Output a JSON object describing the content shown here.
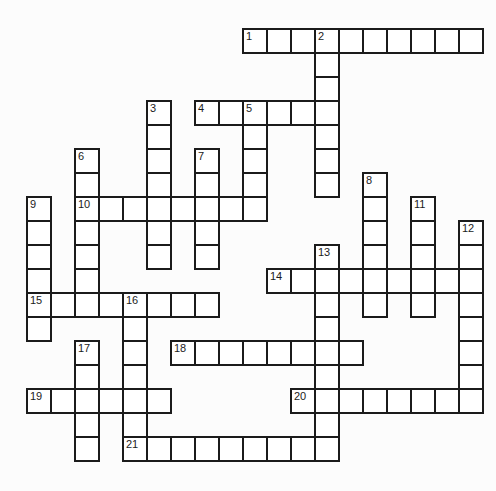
{
  "puzzle": {
    "type": "crossword",
    "grid": {
      "columns": 19,
      "rows": 18,
      "cell_size_px": 24,
      "origin_x_px": 27,
      "origin_y_px": 29,
      "line_width_px": 2
    },
    "colors": {
      "grid_line": "#1b1b1b",
      "cell_fill": "#ffffff",
      "page_background": "#fcfcfc",
      "number_text": "#1b1b1b"
    },
    "entries": [
      {
        "number": 1,
        "direction": "across",
        "col": 9,
        "row": 0,
        "length": 10
      },
      {
        "number": 2,
        "direction": "down",
        "col": 12,
        "row": 0,
        "length": 7
      },
      {
        "number": 3,
        "direction": "down",
        "col": 5,
        "row": 3,
        "length": 7
      },
      {
        "number": 4,
        "direction": "across",
        "col": 7,
        "row": 3,
        "length": 6
      },
      {
        "number": 5,
        "direction": "down",
        "col": 9,
        "row": 3,
        "length": 5
      },
      {
        "number": 6,
        "direction": "down",
        "col": 2,
        "row": 5,
        "length": 7
      },
      {
        "number": 7,
        "direction": "down",
        "col": 7,
        "row": 5,
        "length": 5
      },
      {
        "number": 8,
        "direction": "down",
        "col": 14,
        "row": 6,
        "length": 6
      },
      {
        "number": 9,
        "direction": "down",
        "col": 0,
        "row": 7,
        "length": 6
      },
      {
        "number": 10,
        "direction": "across",
        "col": 2,
        "row": 7,
        "length": 8
      },
      {
        "number": 11,
        "direction": "down",
        "col": 16,
        "row": 7,
        "length": 5
      },
      {
        "number": 12,
        "direction": "down",
        "col": 18,
        "row": 8,
        "length": 8
      },
      {
        "number": 13,
        "direction": "down",
        "col": 12,
        "row": 9,
        "length": 9
      },
      {
        "number": 14,
        "direction": "across",
        "col": 10,
        "row": 10,
        "length": 9
      },
      {
        "number": 15,
        "direction": "across",
        "col": 0,
        "row": 11,
        "length": 8
      },
      {
        "number": 16,
        "direction": "down",
        "col": 4,
        "row": 11,
        "length": 7
      },
      {
        "number": 17,
        "direction": "down",
        "col": 2,
        "row": 13,
        "length": 5
      },
      {
        "number": 18,
        "direction": "across",
        "col": 6,
        "row": 13,
        "length": 8
      },
      {
        "number": 19,
        "direction": "across",
        "col": 0,
        "row": 15,
        "length": 6
      },
      {
        "number": 20,
        "direction": "across",
        "col": 11,
        "row": 15,
        "length": 8
      },
      {
        "number": 21,
        "direction": "across",
        "col": 4,
        "row": 17,
        "length": 9
      }
    ]
  }
}
